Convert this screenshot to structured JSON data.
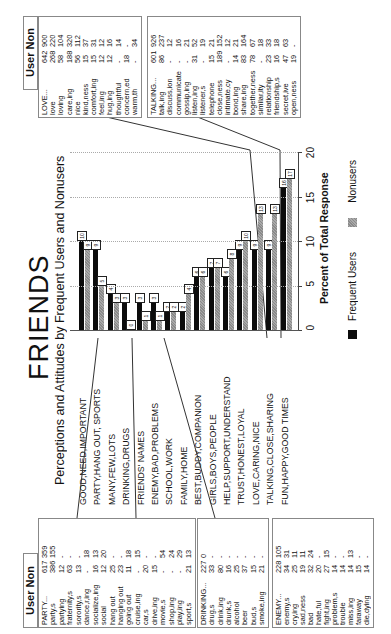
{
  "title": "FRIENDS",
  "subtitle": "Perceptions and Attitudes by Frequent Users and Nonusers",
  "xlabel": "Percent of Total Response",
  "ticks": [
    "0",
    "5",
    "10",
    "15",
    "20"
  ],
  "legend": {
    "users": "Frequent Users",
    "nonusers": "Nonusers"
  },
  "colors": {
    "users": "#0c0c0c",
    "nonusers": "#9a9a9a"
  },
  "table_header": "User Non",
  "chart_data": {
    "type": "bar",
    "orientation": "horizontal",
    "title": "FRIENDS",
    "subtitle": "Perceptions and Attitudes by Frequent Users and Nonusers",
    "xlabel": "Percent of Total Response",
    "ylabel": "",
    "xlim": [
      0,
      20
    ],
    "grid": true,
    "legend_position": "bottom",
    "categories": [
      "GOOD,NEED,IMPORTANT",
      "PARTY,HANG OUT, SPORTS",
      "MANY,FEW,LOTS",
      "DRINKING,DRUGS",
      "FRIENDS' NAMES",
      "ENEMY,BAD,PROBLEMS",
      "SCHOOL,WORK",
      "FAMILY,HOME",
      "BEST,BUDDY,COMPANION",
      "GIRLS,BOYS,PEOPLE",
      "HELP,SUPPORT,UNDERSTAND",
      "TRUST,HONEST,LOYAL",
      "LOVE,CARING,NICE",
      "TALKING,CLOSE,SHARING",
      "FUN,HAPPY,GOOD TIMES"
    ],
    "series": [
      {
        "name": "Frequent Users",
        "values": [
          10,
          9,
          4,
          3,
          3,
          3,
          2,
          2,
          6,
          7,
          6,
          9,
          9,
          9,
          16
        ]
      },
      {
        "name": "Nonusers",
        "values": [
          9,
          5,
          3,
          0,
          1,
          1,
          2,
          4,
          6,
          7,
          8,
          10,
          13,
          13,
          17
        ]
      }
    ]
  },
  "tables": {
    "love": {
      "rows": [
        {
          "w": "LOVE...",
          "u": "642",
          "n": "900"
        },
        {
          "w": "love",
          "u": "268",
          "n": "220"
        },
        {
          "w": "loving",
          "u": "58",
          "n": "104"
        },
        {
          "w": "care,ing",
          "u": "188",
          "n": "320"
        },
        {
          "w": "nice",
          "u": "56",
          "n": "112"
        },
        {
          "w": "kind,ness",
          "u": "15",
          "n": "37"
        },
        {
          "w": "comfort,ing",
          "u": "15",
          "n": "31"
        },
        {
          "w": "feel,ing",
          "u": "12",
          "n": "12"
        },
        {
          "w": "hug,ing",
          "u": "12",
          "n": "16"
        },
        {
          "w": "thoughtful",
          "u": "-",
          "n": "14"
        },
        {
          "w": "concern,ed",
          "u": "18",
          "n": "-"
        },
        {
          "w": "warm,th",
          "u": "-",
          "n": "34"
        }
      ]
    },
    "talking": {
      "rows": [
        {
          "w": "TALKING...",
          "u": "601",
          "n": "926"
        },
        {
          "w": "talk,ing",
          "u": "86",
          "n": "237"
        },
        {
          "w": "discuss,ion",
          "u": "-",
          "n": "12"
        },
        {
          "w": "communicate",
          "u": "-",
          "n": "16"
        },
        {
          "w": "gossip,ing",
          "u": "-",
          "n": "21"
        },
        {
          "w": "listen,ing",
          "u": "31",
          "n": "52"
        },
        {
          "w": "listener,s",
          "u": "-",
          "n": "19"
        },
        {
          "w": "telephone",
          "u": "15",
          "n": "21"
        },
        {
          "w": "close,ness",
          "u": "189",
          "n": "152"
        },
        {
          "w": "intimate,cy",
          "u": "-",
          "n": "12"
        },
        {
          "w": "bond,ing",
          "u": "14",
          "n": "21"
        },
        {
          "w": "share,ing",
          "u": "83",
          "n": "164"
        },
        {
          "w": "together,ness",
          "u": "78",
          "n": "67"
        },
        {
          "w": "similar,ity",
          "u": "-",
          "n": "18"
        },
        {
          "w": "relationship",
          "u": "23",
          "n": "33"
        },
        {
          "w": "friendship,s",
          "u": "16",
          "n": "18"
        },
        {
          "w": "secret,ive",
          "u": "47",
          "n": "63"
        },
        {
          "w": "open,ness",
          "u": "19",
          "n": "-"
        }
      ]
    },
    "party": {
      "rows": [
        {
          "w": "PARTY...",
          "u": "617",
          "n": "359"
        },
        {
          "w": "party,s",
          "u": "386",
          "n": "155"
        },
        {
          "w": "partying",
          "u": "12",
          "n": "-"
        },
        {
          "w": "fraternity,s",
          "u": "63",
          "n": "-"
        },
        {
          "w": "sorority,s",
          "u": "13",
          "n": "-"
        },
        {
          "w": "dance,r,ing",
          "u": "-",
          "n": "18"
        },
        {
          "w": "socialize,ing",
          "u": "16",
          "n": "13"
        },
        {
          "w": "social",
          "u": "12",
          "n": "20"
        },
        {
          "w": "hang out",
          "u": "25",
          "n": "-"
        },
        {
          "w": "hanging out",
          "u": "23",
          "n": "-"
        },
        {
          "w": "going out",
          "u": "11",
          "n": "18"
        },
        {
          "w": "cruise,ing",
          "u": "-",
          "n": "15"
        },
        {
          "w": "car,s",
          "u": "20",
          "n": "-"
        },
        {
          "w": "drive,ing",
          "u": "15",
          "n": "-"
        },
        {
          "w": "movie,s",
          "u": "-",
          "n": "54"
        },
        {
          "w": "shop,ing",
          "u": "-",
          "n": "24"
        },
        {
          "w": "play,ing",
          "u": "-",
          "n": "29"
        },
        {
          "w": "sport,s",
          "u": "21",
          "n": "13"
        }
      ]
    },
    "drinking": {
      "rows": [
        {
          "w": "DRINKING...",
          "u": "227",
          "n": "0"
        },
        {
          "w": "drug,s",
          "u": "33",
          "n": "-"
        },
        {
          "w": "drink,ing",
          "u": "80",
          "n": "-"
        },
        {
          "w": "drunk,s",
          "u": "16",
          "n": "-"
        },
        {
          "w": "alcohol",
          "u": "25",
          "n": "-"
        },
        {
          "w": "beer",
          "u": "37",
          "n": "-"
        },
        {
          "w": "bud,s",
          "u": "15",
          "n": "-"
        },
        {
          "w": "smoke,ing",
          "u": "21",
          "n": "-"
        }
      ]
    },
    "enemy": {
      "rows": [
        {
          "w": "ENEMY...",
          "u": "228",
          "n": "105"
        },
        {
          "w": "enemy,s",
          "u": "34",
          "n": "31"
        },
        {
          "w": "cry,ing",
          "u": "25",
          "n": "11"
        },
        {
          "w": "sad,ness",
          "u": "19",
          "n": "11"
        },
        {
          "w": "bad",
          "u": "32",
          "n": "24"
        },
        {
          "w": "hate,ful",
          "u": "20",
          "n": "-"
        },
        {
          "w": "fight,ing",
          "u": "27",
          "n": "15"
        },
        {
          "w": "problem,s",
          "u": "14",
          "n": "-"
        },
        {
          "w": "trouble",
          "u": "14",
          "n": "-"
        },
        {
          "w": "miss,ing",
          "u": "14",
          "n": "13"
        },
        {
          "w": "faraway",
          "u": "15",
          "n": "-"
        },
        {
          "w": "die,dying",
          "u": "14",
          "n": "-"
        }
      ]
    }
  }
}
